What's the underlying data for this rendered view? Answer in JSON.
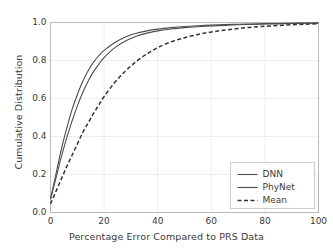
{
  "chart_data": {
    "type": "line",
    "title": "",
    "xlabel": "Percentage Error Compared to PRS Data",
    "ylabel": "Cumulative Distribution",
    "xlim": [
      0,
      100
    ],
    "ylim": [
      0.0,
      1.0
    ],
    "xticks": [
      0,
      20,
      40,
      60,
      80,
      100
    ],
    "xtick_labels": [
      "0",
      "20",
      "40",
      "60",
      "80",
      "100"
    ],
    "yticks": [
      0.0,
      0.2,
      0.4,
      0.6,
      0.8,
      1.0
    ],
    "ytick_labels": [
      "0.0",
      "0.2",
      "0.4",
      "0.6",
      "0.8",
      "1.0"
    ],
    "grid": true,
    "legend_position": "lower right",
    "x": [
      0,
      2,
      4,
      6,
      8,
      10,
      12,
      14,
      16,
      18,
      20,
      24,
      28,
      32,
      36,
      40,
      45,
      50,
      55,
      60,
      65,
      70,
      75,
      80,
      85,
      90,
      95,
      100
    ],
    "series": [
      {
        "name": "DNN",
        "style": "solid",
        "color": "#4d4d4d",
        "values": [
          0.07,
          0.18,
          0.29,
          0.39,
          0.48,
          0.56,
          0.63,
          0.69,
          0.74,
          0.78,
          0.815,
          0.868,
          0.903,
          0.928,
          0.944,
          0.956,
          0.966,
          0.973,
          0.978,
          0.982,
          0.985,
          0.988,
          0.99,
          0.992,
          0.993,
          0.995,
          0.996,
          0.997
        ]
      },
      {
        "name": "PhyNet",
        "style": "solid",
        "color": "#4d4d4d",
        "values": [
          0.07,
          0.2,
          0.33,
          0.44,
          0.54,
          0.62,
          0.69,
          0.745,
          0.79,
          0.825,
          0.853,
          0.895,
          0.924,
          0.943,
          0.956,
          0.965,
          0.973,
          0.979,
          0.983,
          0.986,
          0.989,
          0.991,
          0.992,
          0.994,
          0.995,
          0.996,
          0.997,
          0.998
        ]
      },
      {
        "name": "Mean",
        "style": "dashed",
        "color": "#333333",
        "values": [
          0.045,
          0.11,
          0.175,
          0.24,
          0.3,
          0.36,
          0.42,
          0.47,
          0.52,
          0.565,
          0.61,
          0.685,
          0.745,
          0.795,
          0.835,
          0.868,
          0.898,
          0.92,
          0.937,
          0.95,
          0.96,
          0.968,
          0.975,
          0.98,
          0.984,
          0.988,
          0.991,
          0.994
        ]
      }
    ]
  },
  "legend": {
    "entries": [
      {
        "label": "DNN"
      },
      {
        "label": "PhyNet"
      },
      {
        "label": "Mean"
      }
    ]
  },
  "colors": {
    "axis": "#b8b8b8",
    "grid": "#ededed",
    "text": "#3b3b3b",
    "curve": "#4d4d4d",
    "background": "#ffffff"
  }
}
